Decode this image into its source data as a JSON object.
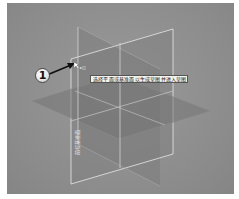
{
  "viewport": {
    "background": "#8f8f8f",
    "plane_fill": "#7a7a7a",
    "plane_edge": "#e6e6e6"
  },
  "planes": [
    {
      "name": "Front Plane",
      "label": "前视基准面"
    },
    {
      "name": "Top Plane"
    },
    {
      "name": "Right Plane"
    }
  ],
  "annotation": {
    "callout_number": "1"
  },
  "cursor": {
    "icon": "pointer-with-plane-icon",
    "label": "▸◫"
  },
  "tooltip": {
    "text": "选择平面或基准面以生成草图并进入草图绘制"
  }
}
